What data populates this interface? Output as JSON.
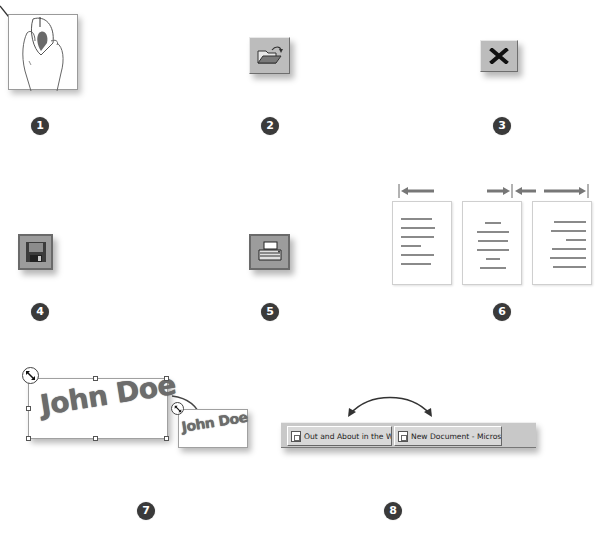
{
  "steps": [
    {
      "number": "1",
      "icon": "mouse-click-icon",
      "description": "hand clicking mouse button"
    },
    {
      "number": "2",
      "icon": "open-folder-icon",
      "description": "Open toolbar button"
    },
    {
      "number": "3",
      "icon": "close-x-icon",
      "description": "Close button"
    },
    {
      "number": "4",
      "icon": "floppy-save-icon",
      "description": "Save toolbar button"
    },
    {
      "number": "5",
      "icon": "printer-icon",
      "description": "Print toolbar button"
    },
    {
      "number": "6",
      "icon": "text-alignment-icon",
      "description": "Left, center and right alignment"
    },
    {
      "number": "7",
      "icon": "resize-handle-icon",
      "description": "Resizing WordArt object"
    },
    {
      "number": "8",
      "icon": "taskbar-switch-icon",
      "description": "Switch between taskbar windows"
    }
  ],
  "wordart": {
    "large_text": "John Doe",
    "small_text": "John Doe"
  },
  "taskbar": {
    "buttons": [
      {
        "label": "Out and About in the Wo...",
        "icon": "web-page-icon"
      },
      {
        "label": "New Document - Microso...",
        "icon": "word-document-icon"
      }
    ]
  },
  "colors": {
    "badge": "#3a3a3a",
    "button_face": "#bcbcbc",
    "text_gray": "#6c6c6c"
  }
}
